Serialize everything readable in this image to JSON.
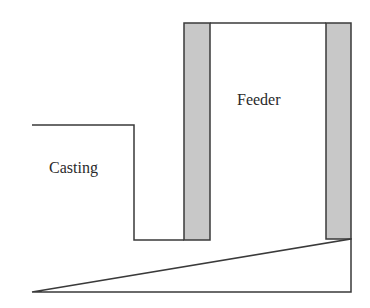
{
  "diagram": {
    "labels": {
      "casting": "Casting",
      "feeder": "Feeder"
    },
    "colors": {
      "outline": "#3a3a3a",
      "sleeve_fill": "#c8c8c8",
      "background": "#ffffff"
    }
  }
}
